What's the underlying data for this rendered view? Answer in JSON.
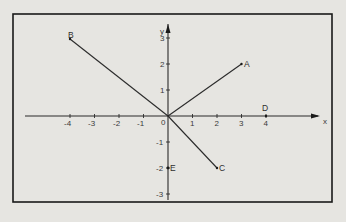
{
  "diagram": {
    "axes": {
      "x_label": "x",
      "y_label": "y",
      "origin_label": "0",
      "x_ticks": [
        "-4",
        "-3",
        "-2",
        "-1",
        "1",
        "2",
        "3",
        "4"
      ],
      "y_ticks": [
        "3",
        "2",
        "1",
        "-1",
        "-2",
        "-3"
      ]
    },
    "points": {
      "A": {
        "label": "A",
        "x": 3,
        "y": 2
      },
      "B": {
        "label": "B",
        "x": -4,
        "y": 3
      },
      "C": {
        "label": "C",
        "x": 2,
        "y": -2
      },
      "D": {
        "label": "D",
        "x": 4,
        "y": 0
      },
      "E": {
        "label": "E",
        "x": 0,
        "y": -2
      }
    },
    "segments": [
      {
        "from": "origin",
        "to": "A"
      },
      {
        "from": "origin",
        "to": "B"
      },
      {
        "from": "origin",
        "to": "C"
      }
    ],
    "colors": {
      "background": "#e6e5e1",
      "frame": "#1a1a1a",
      "line": "#2b2b2b"
    }
  }
}
